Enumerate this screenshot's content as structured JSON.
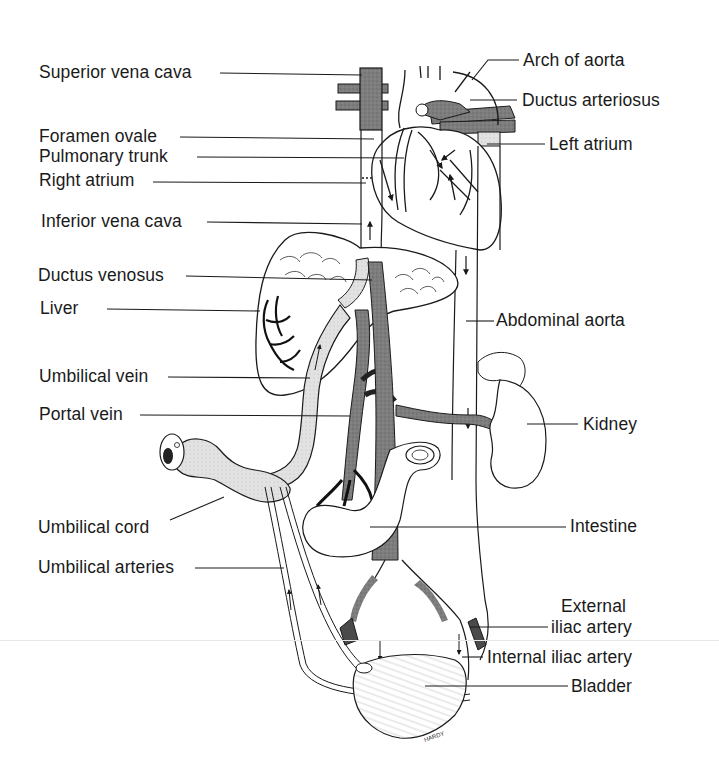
{
  "diagram": {
    "signature": "HARDY",
    "colors": {
      "ink": "#1a1a1a",
      "venous_shade": "#8a8a8a",
      "dark_vessel": "#555555",
      "light_vessel": "#dcdcdc",
      "background": "#ffffff"
    },
    "labels_left": [
      {
        "id": "superior-vena-cava",
        "text": "Superior vena cava"
      },
      {
        "id": "foramen-ovale",
        "text": "Foramen ovale"
      },
      {
        "id": "pulmonary-trunk",
        "text": "Pulmonary trunk"
      },
      {
        "id": "right-atrium",
        "text": "Right atrium"
      },
      {
        "id": "inferior-vena-cava",
        "text": "Inferior vena cava"
      },
      {
        "id": "ductus-venosus",
        "text": "Ductus venosus"
      },
      {
        "id": "liver",
        "text": "Liver"
      },
      {
        "id": "umbilical-vein",
        "text": "Umbilical vein"
      },
      {
        "id": "portal-vein",
        "text": "Portal vein"
      },
      {
        "id": "umbilical-cord",
        "text": "Umbilical cord"
      },
      {
        "id": "umbilical-arteries",
        "text": "Umbilical arteries"
      }
    ],
    "labels_right": [
      {
        "id": "arch-of-aorta",
        "text": "Arch of aorta"
      },
      {
        "id": "ductus-arteriosus",
        "text": "Ductus arteriosus"
      },
      {
        "id": "left-atrium",
        "text": "Left atrium"
      },
      {
        "id": "abdominal-aorta",
        "text": "Abdominal aorta"
      },
      {
        "id": "kidney",
        "text": "Kidney"
      },
      {
        "id": "intestine",
        "text": "Intestine"
      },
      {
        "id": "external-iliac-artery-line1",
        "text": "External"
      },
      {
        "id": "external-iliac-artery-line2",
        "text": "iliac artery"
      },
      {
        "id": "internal-iliac-artery",
        "text": "Internal iliac artery"
      },
      {
        "id": "bladder",
        "text": "Bladder"
      }
    ]
  }
}
